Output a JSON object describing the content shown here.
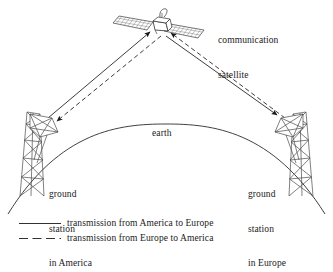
{
  "figure": {
    "title_text_present": false,
    "labels": {
      "satellite": "communication\nsatellite",
      "satellite_line1": "communication",
      "satellite_line2": "satellite",
      "earth": "earth",
      "ground_station_america": "ground\nstation\nin America",
      "ground_station_america_line1": "ground",
      "ground_station_america_line2": "station",
      "ground_station_america_line3": "in America",
      "ground_station_europe": "ground\nstation\nin Europe",
      "ground_station_europe_line1": "ground",
      "ground_station_europe_line2": "station",
      "ground_station_europe_line3": "in Europe"
    },
    "legend": {
      "items": [
        {
          "style": "solid",
          "label": "transmission from America to Europe"
        },
        {
          "style": "dashed",
          "label": "transmission from Europe to America"
        }
      ]
    },
    "colors": {
      "ink": "#1a1a1a",
      "line": "#2b2b2b",
      "background": "#ffffff",
      "structure": "#555555"
    },
    "diagram_elements": {
      "satellite": {
        "name": "communication satellite",
        "position": {
          "x": 160,
          "y": 24
        },
        "solar_panels": 2,
        "panel_grid_columns": 9,
        "panel_grid_rows": 3
      },
      "earth": {
        "name": "earth",
        "shape": "arc",
        "peak": {
          "x": 166,
          "y": 124
        }
      },
      "ground_station_america": {
        "name": "ground station in America",
        "position": {
          "x": 44,
          "y": 130
        },
        "type": "lattice-tower-with-dish"
      },
      "ground_station_europe": {
        "name": "ground station in Europe",
        "position": {
          "x": 288,
          "y": 130
        },
        "type": "lattice-tower-with-dish"
      },
      "beams": [
        {
          "name": "uplink-america-to-satellite",
          "style": "solid",
          "from": "ground_station_america",
          "to": "satellite",
          "arrow_at": "satellite"
        },
        {
          "name": "downlink-satellite-to-europe",
          "style": "solid",
          "from": "satellite",
          "to": "ground_station_europe",
          "arrow_at": "ground_station_europe"
        },
        {
          "name": "uplink-europe-to-satellite",
          "style": "dashed",
          "from": "ground_station_europe",
          "to": "satellite",
          "arrow_at": "satellite"
        },
        {
          "name": "downlink-satellite-to-america",
          "style": "dashed",
          "from": "satellite",
          "to": "ground_station_america",
          "arrow_at": "ground_station_america"
        }
      ]
    }
  }
}
